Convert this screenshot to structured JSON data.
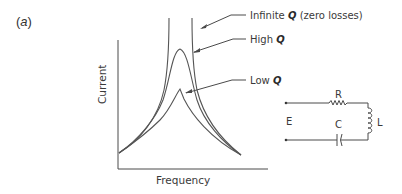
{
  "figure": {
    "panel_label_open": "(",
    "panel_label_letter": "a",
    "panel_label_close": ")"
  },
  "graph": {
    "y_axis_label": "Current",
    "x_axis_label": "Frequency",
    "curves": [
      {
        "name": "infinite-q",
        "label_prefix": "Infinite ",
        "label_q": "Q",
        "label_suffix": " (zero losses)"
      },
      {
        "name": "high-q",
        "label_prefix": "High ",
        "label_q": "Q",
        "label_suffix": ""
      },
      {
        "name": "low-q",
        "label_prefix": "Low ",
        "label_q": "Q",
        "label_suffix": ""
      }
    ]
  },
  "circuit": {
    "source_label": "E",
    "resistor_label": "R",
    "capacitor_label": "C",
    "inductor_label": "L"
  },
  "colors": {
    "line": "#4a4a4a",
    "text": "#3a3a3a",
    "background": "#ffffff"
  }
}
